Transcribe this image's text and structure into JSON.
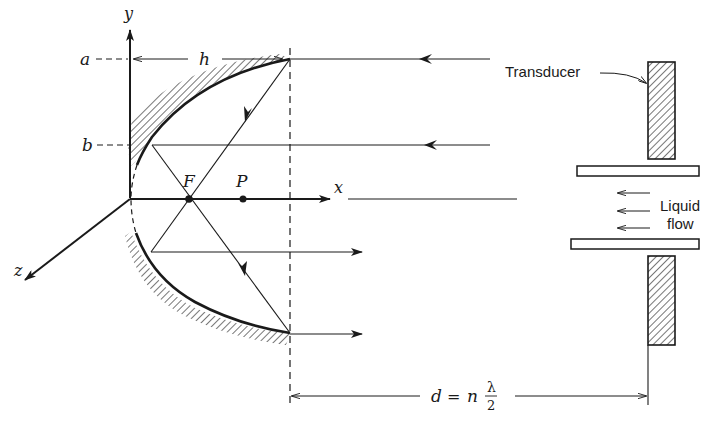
{
  "figure": {
    "type": "diagram"
  },
  "axes": {
    "x_label": "x",
    "y_label": "y",
    "z_label": "z"
  },
  "points": {
    "focus_label": "F",
    "point_label": "P"
  },
  "levels": {
    "a_label": "a",
    "b_label": "b",
    "h_label": "h"
  },
  "transducer": {
    "label": "Transducer"
  },
  "flow": {
    "line1": "Liquid",
    "line2": "flow"
  },
  "dimension": {
    "d": "d",
    "equals": "=",
    "n": "n",
    "numerator": "λ",
    "denominator": "2"
  },
  "colors": {
    "ink": "#1a1a1a",
    "background": "#ffffff"
  }
}
